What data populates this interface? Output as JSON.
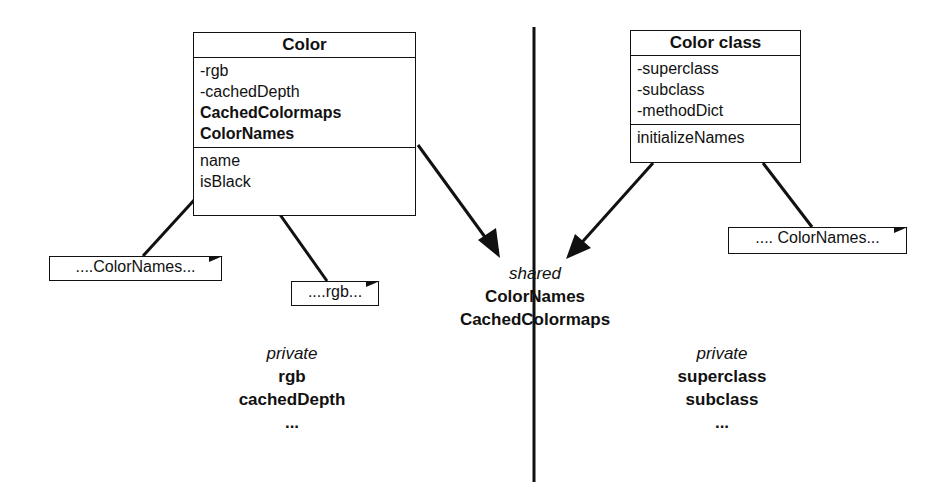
{
  "diagram": {
    "left_class": {
      "name": "Color",
      "attributes": [
        {
          "text": "-rgb",
          "bold": false
        },
        {
          "text": "-cachedDepth",
          "bold": false
        },
        {
          "text": "CachedColormaps",
          "bold": true
        },
        {
          "text": "ColorNames",
          "bold": true
        }
      ],
      "methods": [
        "name",
        "isBlack"
      ]
    },
    "right_class": {
      "name": "Color class",
      "attributes": [
        "-superclass",
        "-subclass",
        "-methodDict"
      ],
      "methods": [
        "initializeNames"
      ]
    },
    "notes": [
      {
        "id": "note-colornames-left",
        "text": "....ColorNames..."
      },
      {
        "id": "note-rgb",
        "text": "....rgb..."
      },
      {
        "id": "note-colornames-right",
        "text": ".... ColorNames..."
      }
    ],
    "shared": {
      "caption": "shared",
      "items": [
        "ColorNames",
        "CachedColormaps"
      ]
    },
    "private_left": {
      "caption": "private",
      "items": [
        "rgb",
        "cachedDepth",
        "..."
      ]
    },
    "private_right": {
      "caption": "private",
      "items": [
        "superclass",
        "subclass",
        "..."
      ]
    },
    "colors": {
      "line": "#111111",
      "background": "#ffffff"
    }
  }
}
